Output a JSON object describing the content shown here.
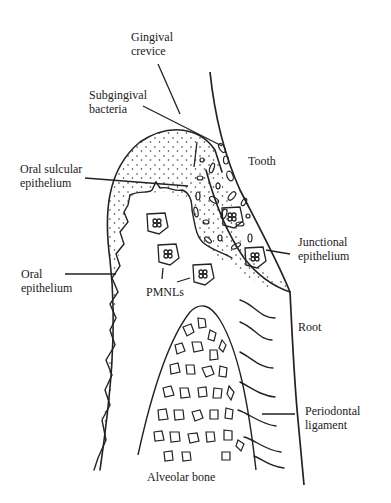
{
  "diagram": {
    "type": "anatomical-illustration",
    "colors": {
      "ink": "#222222",
      "background": "#ffffff"
    },
    "labels": {
      "gingival_crevice": {
        "line1": "Gingival",
        "line2": "crevice"
      },
      "subgingival_bacteria": {
        "line1": "Subgingival",
        "line2": "bacteria"
      },
      "tooth": "Tooth",
      "oral_sulcular_epithelium": {
        "line1": "Oral sulcular",
        "line2": "epithelium"
      },
      "junctional_epithelium": {
        "line1": "Junctional",
        "line2": "epithelium"
      },
      "oral_epithelium": {
        "line1": "Oral",
        "line2": "epithelium"
      },
      "pmnls": "PMNLs",
      "root": "Root",
      "periodontal_ligament": {
        "line1": "Periodontal",
        "line2": "ligament"
      },
      "alveolar_bone": "Alveolar bone"
    }
  }
}
